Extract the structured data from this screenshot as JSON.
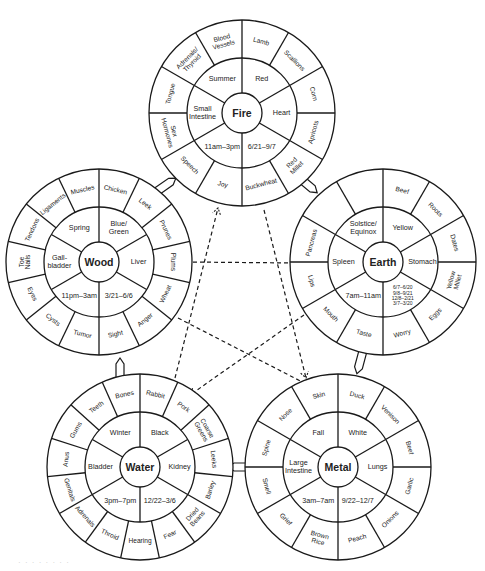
{
  "colors": {
    "line": "#1a1a1a",
    "text": "#222222",
    "background": "#ffffff"
  },
  "wheels": [
    {
      "element": "Fire",
      "cx": 242,
      "cy": 113,
      "angle": 0,
      "inner": [
        "Red",
        "Heart",
        "6/21–9/7",
        "11am–3pm",
        "Small Intestine",
        "Summer"
      ],
      "outer": [
        "Lamb",
        "Scallions",
        "Corn",
        "Apricots",
        "Red Millet",
        "Buckwheat",
        "Joy",
        "Speech",
        "Sex Hormones",
        "Tongue",
        "Adrenals/ Thyroid",
        "Blood Vessels"
      ]
    },
    {
      "element": "Earth",
      "cx": 383,
      "cy": 262,
      "angle": 0,
      "inner": [
        "Yellow",
        "Stomach",
        "6/7–6/20 9/8–9/21 12/8–2/21 3/7–3/20",
        "7am–11am",
        "Spleen",
        "Solstice/ Equinox"
      ],
      "outer": [
        "Beef",
        "Roots",
        "Dates",
        "Yellow Millet",
        "Eggs",
        "Worry",
        "Taste",
        "Mouth",
        "Lips",
        "Pancreas",
        "",
        ""
      ]
    },
    {
      "element": "Metal",
      "cx": 338,
      "cy": 467,
      "angle": 0,
      "inner": [
        "White",
        "Lungs",
        "9/22–12/7",
        "3am–7am",
        "Large Intestine",
        "Fall"
      ],
      "outer": [
        "Duck",
        "Venison",
        "Beef",
        "Garlic",
        "Onions",
        "Peach",
        "Brown Rice",
        "Grief",
        "Smell",
        "Spine",
        "Nose",
        "Skin"
      ]
    },
    {
      "element": "Water",
      "cx": 140,
      "cy": 467,
      "angle": 0,
      "inner": [
        "Black",
        "Kidney",
        "12/22–3/6",
        "3pm–7pm",
        "Bladder",
        "Winter"
      ],
      "outer": [
        "Rabbit",
        "Pork",
        "Coarse Greens",
        "Leeks",
        "Barley",
        "Dried Beans",
        "Fear",
        "Hearing",
        "Throid",
        "Adrenals",
        "Genitals",
        "Anus",
        "Gums",
        "Teeth",
        "Bones"
      ]
    },
    {
      "element": "Wood",
      "cx": 99,
      "cy": 262,
      "angle": 0,
      "inner": [
        "Blue/ Green",
        "Liver",
        "3/21–6/6",
        "11pm–3am",
        "Gall- bladder",
        "Spring"
      ],
      "outer": [
        "Chicken",
        "Leek",
        "Prunes",
        "Plums",
        "Wheat",
        "Anger",
        "Sight",
        "Tumor",
        "Cysts",
        "Eyes",
        "Toe Nails",
        "Tendons",
        "Ligaments",
        "Muscles"
      ]
    }
  ],
  "caption": "· · · · · · · ·"
}
